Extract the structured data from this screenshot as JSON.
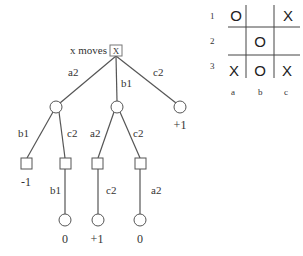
{
  "tree": {
    "root": {
      "label": "x moves",
      "marker": "X"
    },
    "edges": {
      "a2": "a2",
      "b1": "b1",
      "c2": "c2",
      "l_b1": "b1",
      "l_c2": "c2",
      "m_a2": "a2",
      "m_c2": "c2",
      "d1": "b1",
      "d2": "c2",
      "d3": "a2"
    },
    "values": {
      "right": "+1",
      "leaf_left": "-1",
      "leaf1": "0",
      "leaf2": "+1",
      "leaf3": "0"
    }
  },
  "board": {
    "row_labels": [
      "1",
      "2",
      "3"
    ],
    "col_labels": [
      "a",
      "b",
      "c"
    ],
    "cells": [
      [
        "O",
        "",
        "X"
      ],
      [
        "",
        "O",
        ""
      ],
      [
        "X",
        "O",
        "X"
      ]
    ]
  }
}
